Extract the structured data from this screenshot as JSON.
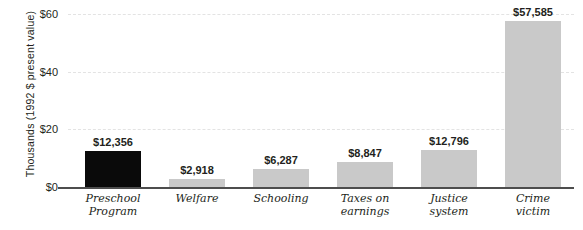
{
  "chart_data": {
    "type": "bar",
    "title": "",
    "xlabel": "",
    "ylabel": "Thousands (1992 $ present value)",
    "categories": [
      "Preschool Program",
      "Welfare",
      "Schooling",
      "Taxes on earnings",
      "Justice system",
      "Crime victim"
    ],
    "category_lines": [
      [
        "Preschool",
        "Program"
      ],
      [
        "Welfare",
        ""
      ],
      [
        "Schooling",
        ""
      ],
      [
        "Taxes on",
        "earnings"
      ],
      [
        "Justice",
        "system"
      ],
      [
        "Crime",
        "victim"
      ]
    ],
    "values": [
      12356,
      2918,
      6287,
      8847,
      12796,
      57585
    ],
    "value_labels": [
      "$12,356",
      "$2,918",
      "$6,287",
      "$8,847",
      "$12,796",
      "$57,585"
    ],
    "bar_colors": [
      "#0a0a0a",
      "#c9c9c9",
      "#c9c9c9",
      "#c9c9c9",
      "#c9c9c9",
      "#c9c9c9"
    ],
    "ylim": [
      0,
      60000
    ],
    "yticks": [
      0,
      20000,
      40000,
      60000
    ],
    "ytick_labels": [
      "$0",
      "$20",
      "$40",
      "$60"
    ],
    "grid": true,
    "legend": "none",
    "units": "thousands of 1992 dollars, present value"
  },
  "axis": {
    "y_title": "Thousands (1992 $ present value)"
  }
}
